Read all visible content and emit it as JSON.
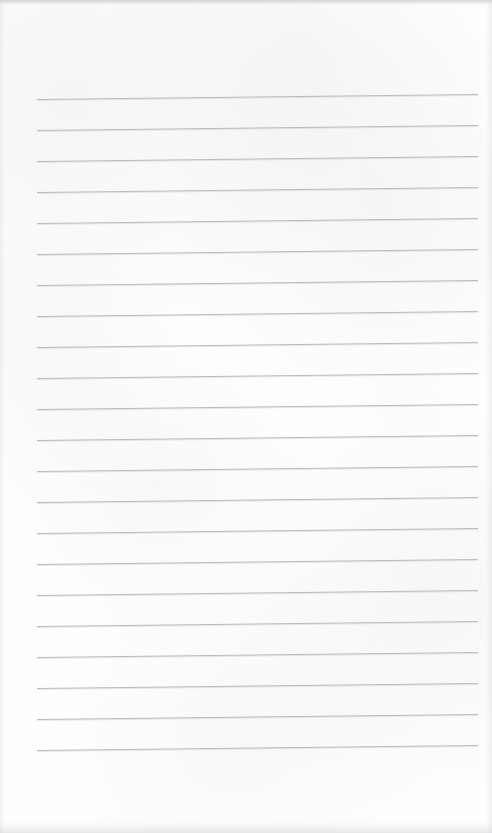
{
  "page": {
    "kind": "lined-notepad-page",
    "width": 492,
    "height": 833,
    "background_color": "#fefefe",
    "has_text_content": false,
    "text_content": "",
    "visible_labels": []
  },
  "paper": {
    "surface_color": "#fefefe",
    "texture": "subtle-scan-mottling",
    "edge_artifacts": [
      {
        "name": "top-edge-noise-band",
        "edge": "top",
        "thickness_px": 6,
        "color": "#b2b2b8"
      },
      {
        "name": "bottom-edge-noise-band",
        "edge": "bottom",
        "thickness_px": 14,
        "color": "#c4c4ca"
      },
      {
        "name": "left-edge-shading",
        "edge": "left",
        "thickness_px": 5,
        "color": "#ceced4"
      },
      {
        "name": "right-edge-shading",
        "edge": "right",
        "thickness_px": 6,
        "color": "#ccccd2"
      }
    ]
  },
  "ruling": {
    "line_color": "#b7b7bc",
    "line_thickness_px": 1,
    "line_count": 22,
    "left_margin_px": 37,
    "right_margin_px": 478,
    "line_length_px": 441,
    "first_line_y_px": 97,
    "last_line_y_px": 748,
    "spacing_px": 31,
    "skew_deg": -0.62,
    "skew_note": "lines rise slightly from left to right due to scan skew",
    "lines": [
      {
        "index": 1,
        "y_left_px": 99,
        "y_right_px": 94
      },
      {
        "index": 2,
        "y_left_px": 130,
        "y_right_px": 125
      },
      {
        "index": 3,
        "y_left_px": 161,
        "y_right_px": 156
      },
      {
        "index": 4,
        "y_left_px": 192,
        "y_right_px": 187
      },
      {
        "index": 5,
        "y_left_px": 223,
        "y_right_px": 218
      },
      {
        "index": 6,
        "y_left_px": 254,
        "y_right_px": 249
      },
      {
        "index": 7,
        "y_left_px": 285,
        "y_right_px": 280
      },
      {
        "index": 8,
        "y_left_px": 316,
        "y_right_px": 311
      },
      {
        "index": 9,
        "y_left_px": 347,
        "y_right_px": 342
      },
      {
        "index": 10,
        "y_left_px": 378,
        "y_right_px": 373
      },
      {
        "index": 11,
        "y_left_px": 409,
        "y_right_px": 404
      },
      {
        "index": 12,
        "y_left_px": 440,
        "y_right_px": 435
      },
      {
        "index": 13,
        "y_left_px": 471,
        "y_right_px": 466
      },
      {
        "index": 14,
        "y_left_px": 502,
        "y_right_px": 497
      },
      {
        "index": 15,
        "y_left_px": 533,
        "y_right_px": 528
      },
      {
        "index": 16,
        "y_left_px": 564,
        "y_right_px": 559
      },
      {
        "index": 17,
        "y_left_px": 595,
        "y_right_px": 590
      },
      {
        "index": 18,
        "y_left_px": 626,
        "y_right_px": 621
      },
      {
        "index": 19,
        "y_left_px": 657,
        "y_right_px": 652
      },
      {
        "index": 20,
        "y_left_px": 688,
        "y_right_px": 683
      },
      {
        "index": 21,
        "y_left_px": 719,
        "y_right_px": 714
      },
      {
        "index": 22,
        "y_left_px": 750,
        "y_right_px": 745
      }
    ]
  }
}
